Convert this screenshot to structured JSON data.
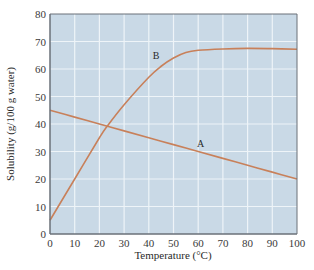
{
  "chart_data": {
    "type": "line",
    "title": "",
    "xlabel": "Temperature (°C)",
    "ylabel": "Solubility (g/100 g water)",
    "xlim": [
      0,
      100
    ],
    "ylim": [
      0,
      80
    ],
    "xticks": [
      0,
      10,
      20,
      30,
      40,
      50,
      60,
      70,
      80,
      90,
      100
    ],
    "yticks": [
      0,
      10,
      20,
      30,
      40,
      50,
      60,
      70,
      80
    ],
    "grid": true,
    "legend": "none (curves labeled inline)",
    "series": [
      {
        "name": "A",
        "x": [
          0,
          10,
          20,
          30,
          40,
          50,
          60,
          70,
          80,
          90,
          100
        ],
        "values": [
          45,
          42.5,
          40,
          37.5,
          35,
          32.5,
          30,
          27.5,
          25,
          22.5,
          20
        ],
        "label_pos": {
          "x": 61,
          "y": 31.5
        }
      },
      {
        "name": "B",
        "x": [
          0,
          10,
          20,
          23,
          30,
          40,
          45,
          50,
          55,
          60,
          70,
          80,
          90,
          100
        ],
        "values": [
          5,
          20,
          35,
          39,
          47,
          57,
          61,
          64,
          66,
          66.8,
          67.3,
          67.5,
          67.4,
          67.2
        ],
        "label_pos": {
          "x": 43,
          "y": 63.5
        }
      }
    ]
  },
  "colors": {
    "plot_background": "#c9d9e6",
    "gridline": "#eef4f8",
    "curve": "#c8805a",
    "axis": "#6a7078"
  }
}
